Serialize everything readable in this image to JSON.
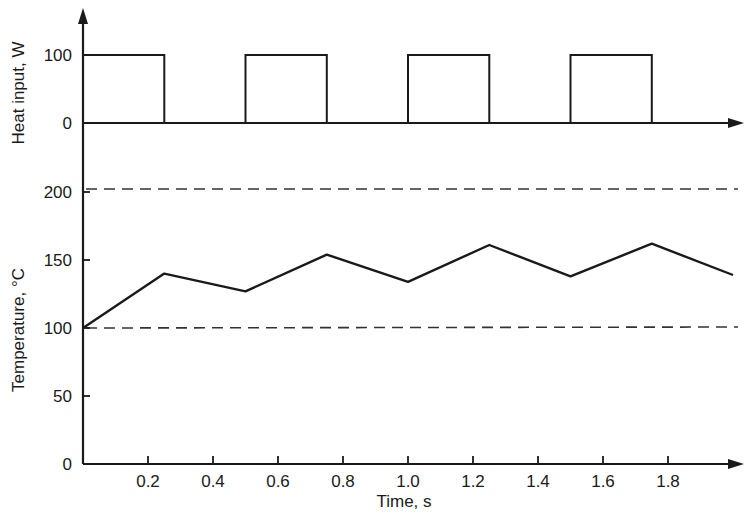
{
  "chart_data": [
    {
      "type": "line",
      "panel": "heat-input",
      "title": "",
      "xlabel": "Time, s",
      "ylabel": "Heat input, W",
      "xlim": [
        0,
        2.0
      ],
      "ylim": [
        0,
        100
      ],
      "yticks": [
        0,
        100
      ],
      "step": true,
      "series": [
        {
          "name": "Heat input",
          "x": [
            0,
            0.25,
            0.25,
            0.5,
            0.5,
            0.75,
            0.75,
            1.0,
            1.0,
            1.25,
            1.25,
            1.5,
            1.5,
            1.75,
            1.75,
            2.0
          ],
          "values": [
            100,
            100,
            0,
            0,
            100,
            100,
            0,
            0,
            100,
            100,
            0,
            0,
            100,
            100,
            0,
            0
          ]
        }
      ],
      "grid": false
    },
    {
      "type": "line",
      "panel": "temperature",
      "title": "",
      "xlabel": "Time, s",
      "ylabel": "Temperature, °C",
      "xlim": [
        0,
        2.0
      ],
      "ylim": [
        0,
        200
      ],
      "xticks": [
        0.2,
        0.4,
        0.6,
        0.8,
        1.0,
        1.2,
        1.4,
        1.6,
        1.8
      ],
      "yticks": [
        0,
        50,
        100,
        150,
        200
      ],
      "series": [
        {
          "name": "Temperature",
          "x": [
            0,
            0.25,
            0.5,
            0.75,
            1.0,
            1.25,
            1.5,
            1.75,
            2.0
          ],
          "values": [
            100,
            140,
            127,
            154,
            134,
            161,
            138,
            162,
            139
          ]
        }
      ],
      "reference_lines": [
        {
          "y": 100,
          "style": "dashed"
        },
        {
          "y": 200,
          "style": "dashed"
        }
      ],
      "grid": false
    }
  ],
  "labels": {
    "heat_ylabel": "Heat input, W",
    "temp_ylabel": "Temperature, °C",
    "xlabel": "Time, s",
    "heat_ticks": [
      "100",
      "0"
    ],
    "temp_ticks": [
      "200",
      "150",
      "100",
      "50",
      "0"
    ],
    "x_ticks": [
      "0.2",
      "0.4",
      "0.6",
      "0.8",
      "1.0",
      "1.2",
      "1.4",
      "1.6",
      "1.8"
    ]
  }
}
